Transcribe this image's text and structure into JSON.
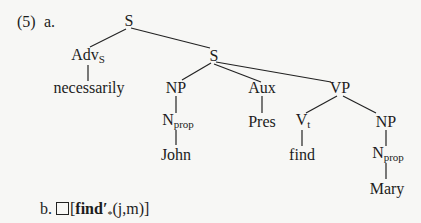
{
  "example": {
    "number": "(5)",
    "part_a_label": "a.",
    "part_b_label": "b."
  },
  "tree": {
    "nodes": {
      "s_root": "S",
      "adv_s": {
        "base": "Adv",
        "sub": "S"
      },
      "necessarily": "necessarily",
      "s_inner": "S",
      "np_subject": "NP",
      "aux": "Aux",
      "vp": "VP",
      "nprop_john": {
        "base": "N",
        "sub": "prop"
      },
      "pres": "Pres",
      "v_t": {
        "base": "V",
        "sub": "t"
      },
      "np_object": "NP",
      "john": "John",
      "find": "find",
      "nprop_mary": {
        "base": "N",
        "sub": "prop"
      },
      "mary": "Mary"
    },
    "edges": [
      [
        "S",
        "Adv_S"
      ],
      [
        "S",
        "S"
      ],
      [
        "Adv_S",
        "necessarily"
      ],
      [
        "S",
        "NP"
      ],
      [
        "S",
        "Aux"
      ],
      [
        "S",
        "VP"
      ],
      [
        "NP",
        "N_prop"
      ],
      [
        "N_prop",
        "John"
      ],
      [
        "Aux",
        "Pres"
      ],
      [
        "VP",
        "V_t"
      ],
      [
        "VP",
        "NP"
      ],
      [
        "V_t",
        "find"
      ],
      [
        "NP",
        "N_prop"
      ],
      [
        "N_prop",
        "Mary"
      ]
    ]
  },
  "formula": {
    "operator": "□",
    "open": "[",
    "predicate": "find′",
    "subscript": "*",
    "args": "(j,m)",
    "close": "]"
  }
}
